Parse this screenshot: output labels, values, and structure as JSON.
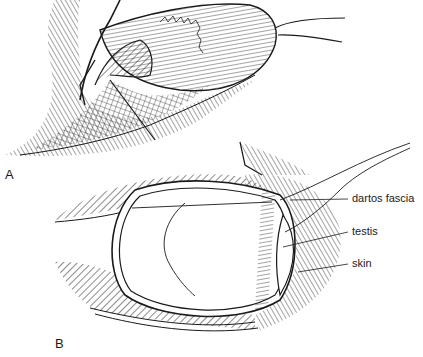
{
  "figure": {
    "panels": [
      {
        "id": "A",
        "label": "A"
      },
      {
        "id": "B",
        "label": "B"
      }
    ],
    "callouts": [
      {
        "text": "dartos fascia"
      },
      {
        "text": "testis"
      },
      {
        "text": "skin"
      }
    ]
  },
  "colors": {
    "ink": "#1a1a1a",
    "background": "#ffffff"
  }
}
